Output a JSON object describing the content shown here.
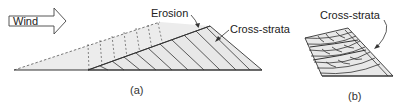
{
  "figure": {
    "panel_a": {
      "wind_label": "Wind",
      "erosion_label": "Erosion",
      "cross_strata_label": "Cross-strata",
      "caption": "(a)"
    },
    "panel_b": {
      "cross_strata_label": "Cross-strata",
      "caption": "(b)"
    },
    "colors": {
      "line": "#333333",
      "fill_light": "#e6e6e6",
      "background": "#ffffff"
    }
  }
}
